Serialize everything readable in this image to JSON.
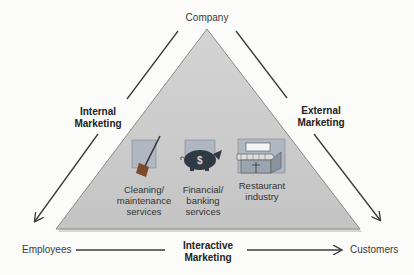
{
  "diagram": {
    "type": "services-marketing-triangle",
    "vertices": {
      "top": "Company",
      "bottom_left": "Employees",
      "bottom_right": "Customers"
    },
    "edges": {
      "left": {
        "line1": "Internal",
        "line2": "Marketing"
      },
      "right": {
        "line1": "External",
        "line2": "Marketing"
      },
      "bottom": {
        "line1": "Interactive",
        "line2": "Marketing"
      }
    },
    "examples": [
      {
        "icon": "broom-icon",
        "line1": "Cleaning/",
        "line2": "maintenance",
        "line3": "services"
      },
      {
        "icon": "piggy-bank-icon",
        "line1": "Financial/",
        "line2": "banking",
        "line3": "services"
      },
      {
        "icon": "restaurant-icon",
        "line1": "Restaurant",
        "line2": "industry",
        "line3": ""
      }
    ],
    "colors": {
      "triangle_fill": "#c9c9c9",
      "triangle_stroke": "#8a8a8a",
      "arrow": "#3a3a3a",
      "icon_bg": "#aeb7c2"
    }
  }
}
